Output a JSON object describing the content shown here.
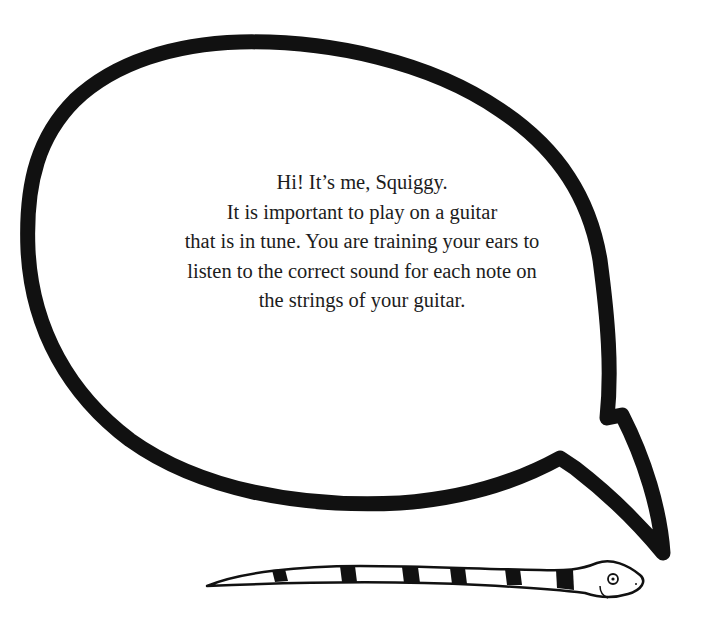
{
  "speech_bubble": {
    "lines": [
      "Hi! It’s me, Squiggy.",
      "It is important to play on a guitar",
      "that is in tune. You are training your ears to",
      "listen to the correct sound for each note on",
      "the strings of your guitar."
    ]
  },
  "illustration": {
    "character": "Squiggy the snake",
    "bubble_outline_color": "#111111",
    "snake_stripe_color": "#111111",
    "background_color": "#ffffff"
  }
}
